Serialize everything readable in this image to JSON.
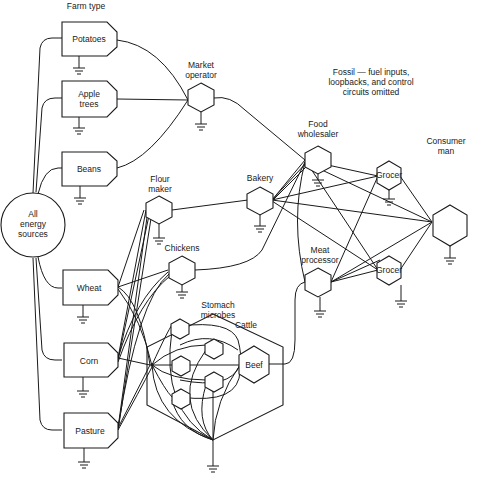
{
  "diagram": {
    "heading": "Farm type",
    "note": [
      "Fossil — fuel inputs,",
      "loopbacks, and control",
      "circuits omitted"
    ],
    "source": {
      "label": [
        "All",
        "energy",
        "sources"
      ]
    },
    "farms": [
      {
        "id": "potatoes",
        "label": [
          "Potatoes"
        ]
      },
      {
        "id": "apple-trees",
        "label": [
          "Apple",
          "trees"
        ]
      },
      {
        "id": "beans",
        "label": [
          "Beans"
        ]
      },
      {
        "id": "wheat",
        "label": [
          "Wheat"
        ]
      },
      {
        "id": "corn",
        "label": [
          "Corn"
        ]
      },
      {
        "id": "pasture",
        "label": [
          "Pasture"
        ]
      }
    ],
    "processors": [
      {
        "id": "market-operator",
        "label": [
          "Market",
          "operator"
        ]
      },
      {
        "id": "flour-maker",
        "label": [
          "Flour",
          "maker"
        ]
      },
      {
        "id": "chickens",
        "label": [
          "Chickens"
        ]
      },
      {
        "id": "bakery",
        "label": [
          "Bakery"
        ]
      },
      {
        "id": "food-wholesaler",
        "label": [
          "Food",
          "wholesaler"
        ]
      },
      {
        "id": "meat-processor",
        "label": [
          "Meat",
          "processor"
        ]
      },
      {
        "id": "grocer-1",
        "label": [
          "Grocer"
        ]
      },
      {
        "id": "grocer-2",
        "label": [
          "Grocer"
        ]
      },
      {
        "id": "consumer-man",
        "label": [
          "Consumer",
          "man"
        ]
      }
    ],
    "cattle_system": {
      "label": "Cattle",
      "microbes_label": [
        "Stomach",
        "microbes"
      ],
      "beef_label": "Beef"
    }
  }
}
